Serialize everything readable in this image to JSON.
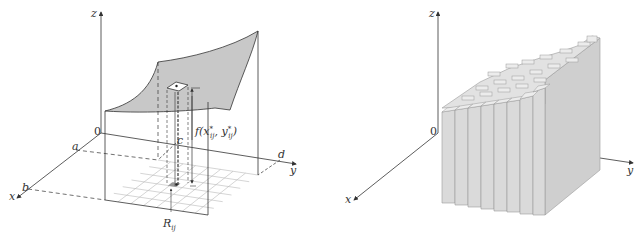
{
  "figures": [
    {
      "id": "left",
      "description": "Surface z = f(x, y) over rectangle R with sub-rectangle R_ij and sample column",
      "labels": {
        "z_axis": "z",
        "x_axis": "x",
        "y_axis": "y",
        "origin": "0",
        "a": "a",
        "b": "b",
        "c": "c",
        "d": "d",
        "height_label": "f(x",
        "height_sub1": "ij",
        "height_sup1": "*",
        "height_mid": ", y",
        "height_sub2": "ij",
        "height_sup2": "*",
        "height_end": ")",
        "region_label": "R",
        "region_sub": "ij"
      },
      "grid": {
        "rows": 6,
        "cols": 8
      }
    },
    {
      "id": "right",
      "description": "Riemann sum approximation using rectangular boxes (columns) beneath the surface",
      "labels": {
        "z_axis": "z",
        "x_axis": "x",
        "y_axis": "y",
        "origin": "0"
      },
      "grid": {
        "rows": 6,
        "cols": 8
      }
    }
  ],
  "colors": {
    "axis": "#333333",
    "surface_fill": "#c8c8c8",
    "grid_line": "#b0b0b0",
    "bar_front": "#dadada",
    "bar_side": "#cfcfcf",
    "bar_top": "#e6e6e6",
    "bar_edge": "#9a9a9a"
  }
}
